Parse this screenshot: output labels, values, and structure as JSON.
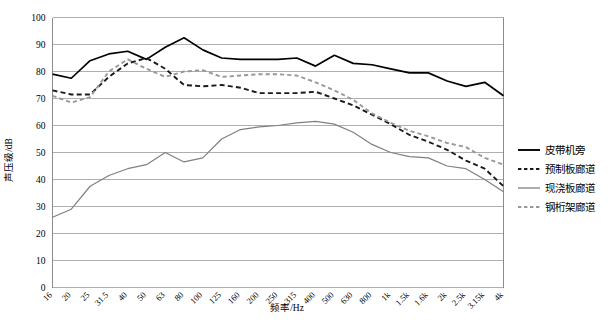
{
  "chart_data": {
    "type": "line",
    "title": "",
    "xlabel": "频率/Hz",
    "ylabel": "声压级/dB",
    "ylim": [
      0,
      100
    ],
    "ytick_step": 10,
    "yticks": [
      "0",
      "10",
      "20",
      "30",
      "40",
      "50",
      "60",
      "70",
      "80",
      "90",
      "100"
    ],
    "grid": true,
    "legend_position": "right",
    "categories": [
      "16",
      "20",
      "25",
      "31.5",
      "40",
      "50",
      "63",
      "80",
      "100",
      "125",
      "160",
      "200",
      "250",
      "315",
      "400",
      "500",
      "630",
      "800",
      "1k",
      "1.5k",
      "1.6k",
      "2k",
      "2.5k",
      "3.15k",
      "4k"
    ],
    "series": [
      {
        "name": "皮带机旁",
        "style": "solid",
        "color": "#000000",
        "values": [
          79,
          77.5,
          84,
          86.5,
          87.5,
          84.5,
          89,
          92.5,
          88,
          85,
          84.5,
          84.5,
          84.5,
          85,
          82,
          86,
          83,
          82.5,
          81,
          79.5,
          79.5,
          76.5,
          74.5,
          76,
          71
        ]
      },
      {
        "name": "预制板廊道",
        "style": "dashed",
        "color": "#1a1a1a",
        "values": [
          73,
          71.5,
          71.5,
          78,
          83,
          85,
          81,
          75,
          74.5,
          75,
          74,
          72,
          72,
          72,
          72.5,
          70,
          67.5,
          64,
          60.5,
          56.5,
          54,
          51,
          47,
          44,
          37.5
        ]
      },
      {
        "name": "现浇板廊道",
        "style": "solid",
        "color": "#808080",
        "values": [
          26,
          29,
          37.5,
          41.5,
          44,
          45.5,
          50,
          46.5,
          48,
          55,
          58.5,
          59.5,
          60,
          61,
          61.5,
          60.5,
          57.5,
          53,
          50,
          48.5,
          48,
          45,
          44,
          40,
          35.5
        ]
      },
      {
        "name": "钢桁架廊道",
        "style": "dashed",
        "color": "#999999",
        "values": [
          71,
          68.5,
          70.5,
          80,
          84.5,
          81,
          78,
          80,
          80.5,
          78,
          78.5,
          79,
          79,
          78.5,
          76,
          73,
          69.5,
          64.5,
          61,
          58,
          56,
          53.5,
          52,
          48,
          45.5
        ]
      }
    ]
  },
  "legend": {
    "items": [
      {
        "label": "皮带机旁"
      },
      {
        "label": "预制板廊道"
      },
      {
        "label": "现浇板廊道"
      },
      {
        "label": "钢桁架廊道"
      }
    ]
  }
}
